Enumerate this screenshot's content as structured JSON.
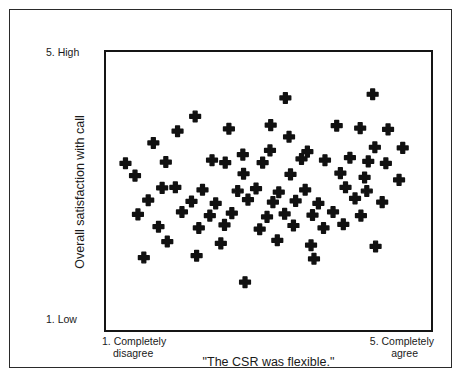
{
  "figure": {
    "marker_color": "#111111",
    "frame_color": "#151515",
    "background": "#ffffff"
  },
  "y_axis": {
    "title": "Overall satisfaction with call",
    "high_label": "5. High",
    "low_label": "1. Low"
  },
  "x_axis": {
    "title": "\"The CSR was flexible.\"",
    "left_label_line1": "1. Completely",
    "left_label_line2": "disagree",
    "right_label_line1": "5. Completely",
    "right_label_line2": "agree"
  },
  "chart_data": {
    "type": "scatter",
    "title": "",
    "xlabel": "\"The CSR was flexible.\"",
    "ylabel": "Overall satisfaction with call",
    "xlim": [
      1,
      5
    ],
    "ylim": [
      1,
      5
    ],
    "grid": false,
    "legend": "none",
    "marker": "bold-cross",
    "xtick_labels": [
      "1. Completely disagree",
      "5. Completely agree"
    ],
    "ytick_labels": [
      "1. Low",
      "5. High"
    ],
    "n_points": 76,
    "points": [
      [
        2.0,
        4.21
      ],
      [
        3.23,
        4.51
      ],
      [
        4.42,
        4.57
      ],
      [
        3.93,
        4.06
      ],
      [
        1.76,
        3.97
      ],
      [
        2.46,
        4.01
      ],
      [
        3.03,
        4.07
      ],
      [
        3.28,
        3.88
      ],
      [
        4.25,
        4.02
      ],
      [
        4.63,
        4.0
      ],
      [
        1.43,
        3.78
      ],
      [
        3.02,
        3.66
      ],
      [
        3.53,
        3.64
      ],
      [
        4.45,
        3.71
      ],
      [
        4.83,
        3.7
      ],
      [
        2.65,
        3.59
      ],
      [
        1.05,
        3.45
      ],
      [
        1.6,
        3.47
      ],
      [
        2.23,
        3.5
      ],
      [
        2.41,
        3.46
      ],
      [
        2.92,
        3.46
      ],
      [
        3.45,
        3.52
      ],
      [
        3.77,
        3.5
      ],
      [
        4.11,
        3.54
      ],
      [
        4.36,
        3.48
      ],
      [
        4.6,
        3.45
      ],
      [
        1.18,
        3.25
      ],
      [
        2.66,
        3.28
      ],
      [
        3.3,
        3.27
      ],
      [
        3.98,
        3.29
      ],
      [
        4.31,
        3.22
      ],
      [
        4.78,
        3.18
      ],
      [
        1.55,
        3.05
      ],
      [
        1.73,
        3.06
      ],
      [
        2.1,
        3.02
      ],
      [
        2.58,
        3.0
      ],
      [
        2.83,
        3.04
      ],
      [
        3.14,
        2.98
      ],
      [
        3.5,
        3.02
      ],
      [
        4.05,
        3.06
      ],
      [
        4.34,
        3.0
      ],
      [
        1.36,
        2.85
      ],
      [
        1.95,
        2.83
      ],
      [
        2.28,
        2.8
      ],
      [
        2.72,
        2.86
      ],
      [
        3.06,
        2.82
      ],
      [
        3.37,
        2.84
      ],
      [
        3.68,
        2.8
      ],
      [
        4.18,
        2.88
      ],
      [
        4.55,
        2.82
      ],
      [
        1.22,
        2.62
      ],
      [
        1.82,
        2.66
      ],
      [
        2.2,
        2.6
      ],
      [
        2.5,
        2.64
      ],
      [
        2.98,
        2.58
      ],
      [
        3.22,
        2.63
      ],
      [
        3.6,
        2.61
      ],
      [
        3.88,
        2.66
      ],
      [
        4.26,
        2.6
      ],
      [
        1.5,
        2.42
      ],
      [
        2.05,
        2.4
      ],
      [
        2.4,
        2.45
      ],
      [
        2.88,
        2.38
      ],
      [
        3.34,
        2.44
      ],
      [
        3.75,
        2.4
      ],
      [
        4.02,
        2.46
      ],
      [
        1.62,
        2.18
      ],
      [
        2.35,
        2.15
      ],
      [
        3.12,
        2.2
      ],
      [
        3.58,
        2.12
      ],
      [
        4.46,
        2.1
      ],
      [
        1.3,
        1.92
      ],
      [
        2.02,
        1.95
      ],
      [
        3.62,
        1.9
      ],
      [
        2.68,
        1.52
      ]
    ]
  }
}
